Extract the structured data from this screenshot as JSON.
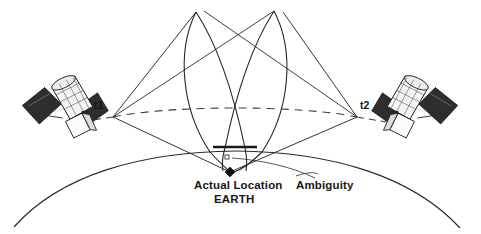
{
  "figure": {
    "background_color": "#ffffff",
    "line_color": "#1c1c1c",
    "text_color": "#161616"
  },
  "labels": {
    "t1": "t1",
    "t2": "t2",
    "actual_location": "Actual Location",
    "earth": "EARTH",
    "ambiguity": "Ambiguity"
  },
  "satellites": [
    {
      "name": "satellite-left",
      "time_label": "t1",
      "body_color": "#f2f2f2",
      "panel_color": "#2e2e2e",
      "outline_color": "#1c1c1c"
    },
    {
      "name": "satellite-right",
      "time_label": "t2",
      "body_color": "#f2f2f2",
      "panel_color": "#2e2e2e",
      "outline_color": "#1c1c1c"
    }
  ],
  "markers": {
    "actual_location": {
      "shape": "filled-diamond",
      "color": "#111111",
      "x": 230,
      "y": 172
    },
    "ambiguity": {
      "shape": "small-open-square",
      "color": "#333333",
      "x": 227,
      "y": 157
    }
  },
  "geometry": {
    "vertex_t1": {
      "x": 113,
      "y": 117
    },
    "vertex_t2": {
      "x": 357,
      "y": 117
    },
    "baseline_style": "dashed",
    "earth_arc_style": "solid",
    "lop_loops": 2,
    "lop_style": "solid"
  }
}
